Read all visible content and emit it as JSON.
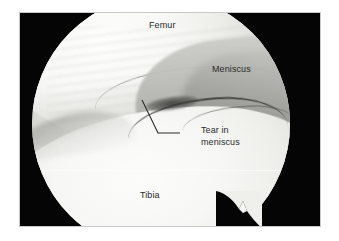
{
  "figure": {
    "kind": "arthroscopic-photograph",
    "view": "circular endoscopic field of view",
    "frame_color": "#050505",
    "page_background": "#ffffff",
    "label_color": "#2a2a2a"
  },
  "labels": {
    "femur": "Femur",
    "meniscus": "Meniscus",
    "tibia": "Tibia",
    "tear_line1": "Tear in",
    "tear_line2": "meniscus"
  },
  "annotations": {
    "leader": {
      "description": "elbow leader line from the tear to the caption",
      "points": "122,87 138,120 160,120"
    }
  },
  "anatomy": {
    "femur": {
      "region": "upper-left bright cartilage mass",
      "tone": "#f8f8f6"
    },
    "meniscus": {
      "region": "mid-right gray wedge band",
      "tone": "#b4b4b0"
    },
    "tibia": {
      "region": "lower bright plateau surface",
      "tone": "#f7f7f5"
    },
    "tear": {
      "region": "dark fissure along the meniscal free edge",
      "tone": "#2e2e2c"
    }
  }
}
